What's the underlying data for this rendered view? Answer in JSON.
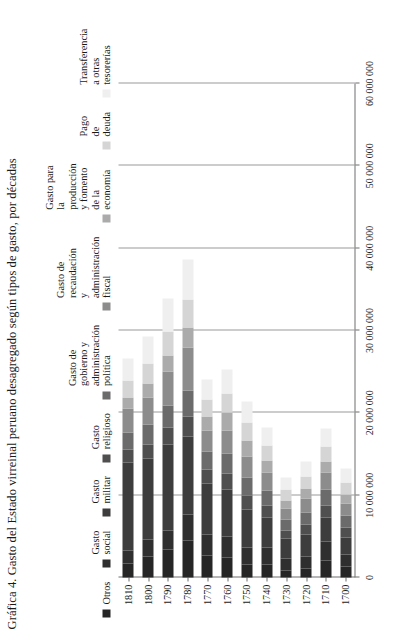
{
  "figure": {
    "title": "Gráfica 4. Gasto del Estado virreinal peruano desagregado según tipos de gasto, por décadas"
  },
  "legend": {
    "items": [
      {
        "label": "Otros",
        "color": "#262626"
      },
      {
        "label": "Gasto social",
        "color": "#2f2f2f"
      },
      {
        "label": "Gasto militar",
        "color": "#3d3d3d"
      },
      {
        "label": "Gasto religioso",
        "color": "#4f4f4f"
      },
      {
        "label": "Gasto de gobierno y\nadministración política",
        "color": "#6b6b6b"
      },
      {
        "label": "Gasto de recaudación\ny administración fiscal",
        "color": "#8c8c8c"
      },
      {
        "label": "Gasto para la producción\ny fomento de la economía",
        "color": "#ababab"
      },
      {
        "label": "Pago de deuda",
        "color": "#d5d5d5"
      },
      {
        "label": "Transferencia a otras\ntesorerías",
        "color": "#efefef"
      }
    ]
  },
  "chart_data": {
    "type": "bar",
    "orientation": "horizontal-stacked",
    "title": "Gráfica 4. Gasto del Estado virreinal peruano desagregado según tipos de gasto, por décadas",
    "xlabel": "",
    "ylabel": "",
    "grid": true,
    "legend_position": "top",
    "axis_ticks": [
      "0",
      "10 000 000",
      "20 000 000",
      "30 000 000",
      "40 000 000",
      "50 000 000",
      "60 000 000"
    ],
    "axis_tick_values": [
      0,
      10000000,
      20000000,
      30000000,
      40000000,
      50000000,
      60000000
    ],
    "xlim": [
      0,
      60000000
    ],
    "categories": [
      "1700",
      "1710",
      "1720",
      "1730",
      "1740",
      "1750",
      "1760",
      "1770",
      "1780",
      "1790",
      "1800",
      "1810"
    ],
    "series": [
      {
        "name": "Otros",
        "color": "#262626",
        "values": [
          1300000,
          2100000,
          1100000,
          900000,
          1600000,
          1600000,
          2400000,
          2700000,
          4500000,
          3400000,
          2500000,
          1700000
        ]
      },
      {
        "name": "Gasto social",
        "color": "#2f2f2f",
        "values": [
          1500000,
          2300000,
          1500000,
          1400000,
          2000000,
          2100000,
          2600000,
          2500000,
          3100000,
          2300000,
          2100000,
          1600000
        ]
      },
      {
        "name": "Gasto militar",
        "color": "#3d3d3d",
        "values": [
          2100000,
          2900000,
          2600000,
          2400000,
          3700000,
          4600000,
          5700000,
          6200000,
          9500000,
          10500000,
          9900000,
          10700000
        ]
      },
      {
        "name": "Gasto religioso",
        "color": "#4f4f4f",
        "values": [
          1200000,
          1500000,
          1200000,
          1000000,
          1400000,
          1700000,
          1900000,
          1700000,
          2400000,
          2000000,
          1700000,
          1500000
        ]
      },
      {
        "name": "Gasto de gobierno y administración política",
        "color": "#6b6b6b",
        "values": [
          1400000,
          1900000,
          1500000,
          1300000,
          1900000,
          2200000,
          2500000,
          2200000,
          3200000,
          2700000,
          2400000,
          2100000
        ]
      },
      {
        "name": "Gasto de recaudación y administración fiscal",
        "color": "#8c8c8c",
        "values": [
          1500000,
          2000000,
          1700000,
          1400000,
          2100000,
          2500000,
          2800000,
          2600000,
          5200000,
          4100000,
          3300000,
          2900000
        ]
      },
      {
        "name": "Gasto para la producción y fomento de la economía",
        "color": "#ababab",
        "values": [
          1100000,
          1400000,
          1200000,
          1000000,
          1500000,
          1900000,
          2100000,
          1700000,
          2500000,
          2000000,
          1700000,
          1400000
        ]
      },
      {
        "name": "Pago de deuda",
        "color": "#d5d5d5",
        "values": [
          1400000,
          1800000,
          1500000,
          1300000,
          1800000,
          2200000,
          2400000,
          2000000,
          3400000,
          2900000,
          2400000,
          2000000
        ]
      },
      {
        "name": "Transferencia a otras tesorerías",
        "color": "#efefef",
        "values": [
          1700000,
          2200000,
          1800000,
          1500000,
          2200000,
          2600000,
          2900000,
          2400000,
          4800000,
          4000000,
          3300000,
          2700000
        ]
      }
    ]
  }
}
